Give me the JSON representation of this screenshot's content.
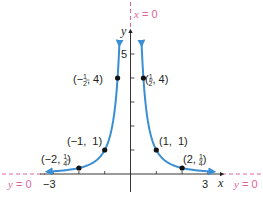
{
  "chart_data": {
    "type": "line",
    "function": "y = 1/x^2",
    "title": "",
    "xlabel": "x",
    "ylabel": "y",
    "xlim": [
      -3.3,
      3.3
    ],
    "ylim": [
      0,
      5.5
    ],
    "x_ticks": [
      -3,
      -2,
      -1,
      1,
      2,
      3
    ],
    "x_tick_labels": [
      {
        "value": -3,
        "label": "−3"
      },
      {
        "value": 3,
        "label": "3"
      }
    ],
    "y_ticks": [
      1,
      2,
      3,
      4,
      5
    ],
    "y_tick_labels": [
      {
        "value": 5,
        "label": "5"
      }
    ],
    "grid": false,
    "series": [
      {
        "name": "y = 1/x^2",
        "color": "#3a8fd4",
        "points": [
          {
            "x": -2,
            "y": 0.25,
            "label": "(−2, 1/4)"
          },
          {
            "x": -1,
            "y": 1,
            "label": "(−1, 1)"
          },
          {
            "x": -0.5,
            "y": 4,
            "label": "(−1/2, 4)"
          },
          {
            "x": 0.5,
            "y": 4,
            "label": "(1/2, 4)"
          },
          {
            "x": 1,
            "y": 1,
            "label": "(1, 1)"
          },
          {
            "x": 2,
            "y": 0.25,
            "label": "(2, 1/4)"
          }
        ]
      }
    ],
    "asymptotes": [
      {
        "type": "vertical",
        "equation": "x = 0",
        "color": "#e0669a"
      },
      {
        "type": "horizontal",
        "equation": "y = 0",
        "color": "#e0669a"
      }
    ]
  },
  "labels": {
    "x_axis": "x",
    "y_axis": "y",
    "tick_5": "5",
    "tick_neg3": "−3",
    "tick_3": "3",
    "asym_vertical": "x = 0",
    "asym_horizontal_left": "y = 0",
    "asym_horizontal_right": "y = 0",
    "pt_neg_half": {
      "pre": "(−",
      "num": "1",
      "den": "2",
      "post": ", 4)"
    },
    "pt_half": {
      "pre": "(",
      "num": "1",
      "den": "2",
      "post": ", 4)"
    },
    "pt_neg1": "(−1,  1)",
    "pt_1": "(1,  1)",
    "pt_neg2": {
      "pre": "(−2, ",
      "num": "1",
      "den": "4",
      "post": ")"
    },
    "pt_2": {
      "pre": "(2, ",
      "num": "1",
      "den": "4",
      "post": ")"
    }
  },
  "colors": {
    "curve": "#3a8fd4",
    "asymptote": "#e0669a",
    "axis": "#231f20",
    "point": "#111111"
  }
}
